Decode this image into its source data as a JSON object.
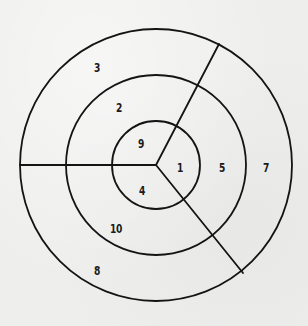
{
  "diagram": {
    "type": "concentric-rings-sectors",
    "center": {
      "x": 156,
      "y": 165
    },
    "rings": [
      {
        "name": "inner",
        "radius": 44
      },
      {
        "name": "middle",
        "radius": 90
      },
      {
        "name": "outer",
        "radius": 136
      }
    ],
    "spokes": [
      {
        "name": "left",
        "angle_deg": 180
      },
      {
        "name": "upper-right",
        "angle_deg": -63
      },
      {
        "name": "lower-right",
        "angle_deg": 48
      }
    ],
    "colors": {
      "line": "#141414",
      "background": "#eeeeed",
      "text": "#1a1a1a"
    },
    "regions": [
      {
        "ring": "outer",
        "sector": "upper-left",
        "label": "3",
        "x": 97,
        "y": 67
      },
      {
        "ring": "middle",
        "sector": "upper-left",
        "label": "2",
        "x": 119,
        "y": 107
      },
      {
        "ring": "inner",
        "sector": "upper-left",
        "label": "9",
        "x": 141,
        "y": 143
      },
      {
        "ring": "inner",
        "sector": "right",
        "label": "1",
        "x": 180,
        "y": 167
      },
      {
        "ring": "middle",
        "sector": "right",
        "label": "5",
        "x": 222,
        "y": 167
      },
      {
        "ring": "outer",
        "sector": "right",
        "label": "7",
        "x": 266,
        "y": 167
      },
      {
        "ring": "inner",
        "sector": "lower-left",
        "label": "4",
        "x": 142,
        "y": 190
      },
      {
        "ring": "middle",
        "sector": "lower-left",
        "label": "10",
        "x": 116,
        "y": 228
      },
      {
        "ring": "outer",
        "sector": "lower-left",
        "label": "8",
        "x": 97,
        "y": 270
      }
    ]
  }
}
